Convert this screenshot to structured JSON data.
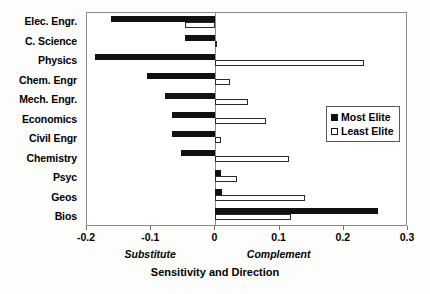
{
  "chart_data": {
    "type": "bar",
    "orientation": "horizontal",
    "title": "",
    "xlabel": "Sensitivity and Direction",
    "ylabel": "",
    "xlim": [
      -0.2,
      0.3
    ],
    "xticks": [
      -0.2,
      -0.1,
      0,
      0.1,
      0.2,
      0.3
    ],
    "xtick_labels": [
      "-0.2",
      "-0.1",
      "0",
      "0.1",
      "0.2",
      "0.3"
    ],
    "grid": false,
    "zero_reference_line": 0,
    "axis_annotations": [
      {
        "text": "Substitute",
        "at": -0.1,
        "style": "italic"
      },
      {
        "text": "Complement",
        "at": 0.1,
        "style": "italic"
      }
    ],
    "categories": [
      "Elec. Engr.",
      "C. Science",
      "Physics",
      "Chem. Engr",
      "Mech. Engr.",
      "Economics",
      "Civil Engr",
      "Chemistry",
      "Psyc",
      "Geos",
      "Bios"
    ],
    "series": [
      {
        "name": "Most Elite",
        "color": "#111111",
        "fill": "solid",
        "values": [
          -0.163,
          -0.047,
          -0.187,
          -0.107,
          -0.079,
          -0.067,
          -0.067,
          -0.053,
          0.009,
          0.01,
          0.254
        ]
      },
      {
        "name": "Least Elite",
        "color": "#ffffff",
        "fill": "hollow",
        "values": [
          -0.047,
          0.002,
          0.232,
          0.023,
          0.051,
          0.079,
          0.009,
          0.115,
          0.034,
          0.139,
          0.117
        ]
      }
    ],
    "legend": {
      "position": "center-right",
      "entries": [
        {
          "label": "Most Elite",
          "swatch": "filled"
        },
        {
          "label": "Least Elite",
          "swatch": "hollow"
        }
      ]
    }
  }
}
